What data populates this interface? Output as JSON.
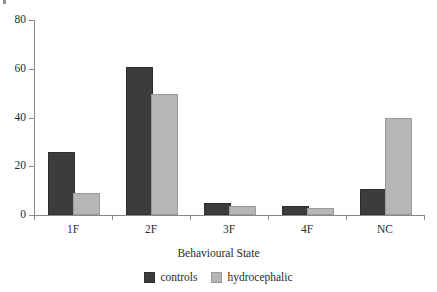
{
  "chart_data": {
    "type": "bar",
    "title": "",
    "xlabel": "Behavioural State",
    "ylabel": "",
    "categories": [
      "1F",
      "2F",
      "3F",
      "4F",
      "NC"
    ],
    "series": [
      {
        "name": "controls",
        "color": "#3c3c3c",
        "values": [
          25,
          60,
          4,
          3,
          10
        ]
      },
      {
        "name": "hydrocephalic",
        "color": "#b6b6b6",
        "values": [
          8,
          49,
          3,
          2,
          39
        ]
      }
    ],
    "ylim": [
      0,
      80
    ],
    "yticks": [
      0,
      20,
      40,
      60,
      80
    ],
    "ytick_labels": [
      "0",
      "20",
      "40",
      "60",
      "80"
    ],
    "grid": false,
    "legend_position": "bottom"
  },
  "axes": {
    "x_title": "Behavioural State"
  },
  "legend": {
    "entries": [
      {
        "label": "controls",
        "color": "#3c3c3c"
      },
      {
        "label": "hydrocephalic",
        "color": "#b6b6b6"
      }
    ]
  }
}
